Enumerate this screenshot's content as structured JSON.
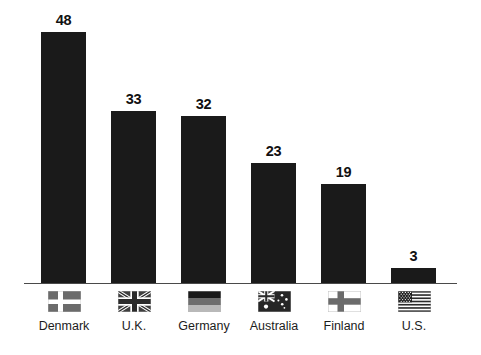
{
  "chart_data": {
    "type": "bar",
    "title": "",
    "subtitle": "",
    "xlabel": "",
    "ylabel": "",
    "categories": [
      "Denmark",
      "U.K.",
      "Germany",
      "Australia",
      "Finland",
      "U.S."
    ],
    "values": [
      48,
      33,
      32,
      23,
      19,
      3
    ],
    "value_labels": [
      "48",
      "33",
      "32",
      "23",
      "19",
      "3"
    ],
    "series": [
      {
        "name": "",
        "values": [
          48,
          33,
          32,
          23,
          19,
          3
        ]
      }
    ],
    "ylim": [
      0,
      54
    ],
    "grid": false,
    "legend": "none",
    "axis": {
      "baseline_visible": true,
      "y_axis_visible": false,
      "tick_labels": []
    },
    "bar_color": "#1a1a1a",
    "value_label_color": "#111111",
    "background_color": "#ffffff",
    "axis_color": "#4a4a4a"
  },
  "bars": [
    {
      "category": "Denmark",
      "value": 48,
      "value_label": "48",
      "flag_icon": "flag-denmark-icon"
    },
    {
      "category": "U.K.",
      "value": 33,
      "value_label": "33",
      "flag_icon": "flag-uk-icon"
    },
    {
      "category": "Germany",
      "value": 32,
      "value_label": "32",
      "flag_icon": "flag-germany-icon"
    },
    {
      "category": "Australia",
      "value": 23,
      "value_label": "23",
      "flag_icon": "flag-australia-icon"
    },
    {
      "category": "Finland",
      "value": 19,
      "value_label": "19",
      "flag_icon": "flag-finland-icon"
    },
    {
      "category": "U.S.",
      "value": 3,
      "value_label": "3",
      "flag_icon": "flag-us-icon"
    }
  ]
}
